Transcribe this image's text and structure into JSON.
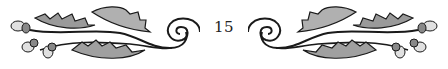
{
  "header": {
    "page_number": "15"
  },
  "ornament": {
    "left": "oak-leaf-acorn-flourish-icon",
    "right": "oak-leaf-acorn-flourish-icon"
  },
  "colors": {
    "ink": "#1a1a1a",
    "leaf_dark": "#8a8a8a",
    "leaf_light": "#c8c8c8",
    "acorn": "#e0e0e0"
  }
}
